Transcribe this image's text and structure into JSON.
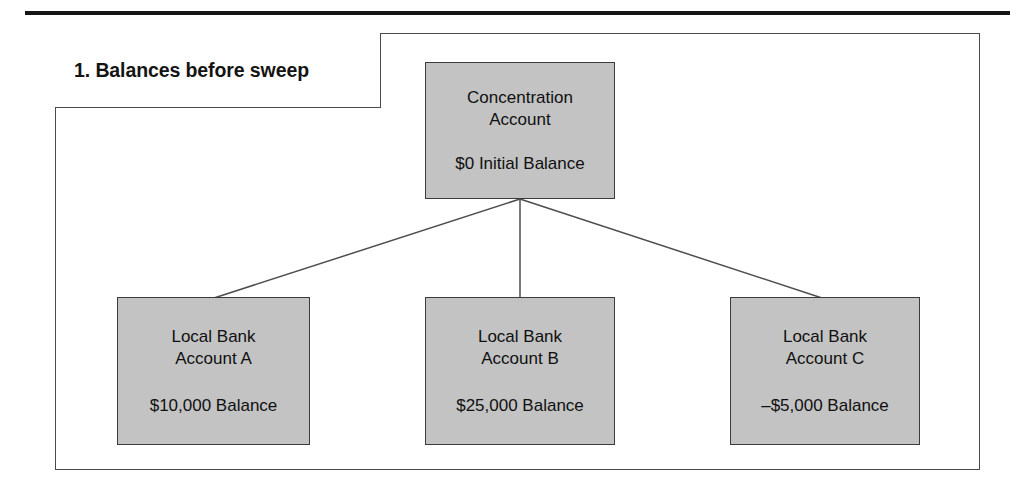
{
  "figure": {
    "step_label": "1. Balances before sweep",
    "fill_color": "#c3c3c3",
    "line_color": "#3c3c3c"
  },
  "diagram": {
    "type": "hierarchy",
    "root": {
      "name": "concentration-account",
      "title": "Concentration\nAccount",
      "balance": "$0 Initial Balance",
      "balance_value": 0
    },
    "children": [
      {
        "name": "local-bank-account-a",
        "title": "Local Bank\nAccount A",
        "balance": "$10,000 Balance",
        "balance_value": 10000
      },
      {
        "name": "local-bank-account-b",
        "title": "Local Bank\nAccount B",
        "balance": "$25,000 Balance",
        "balance_value": 25000
      },
      {
        "name": "local-bank-account-c",
        "title": "Local Bank\nAccount C",
        "balance": "–$5,000 Balance",
        "balance_value": -5000
      }
    ]
  }
}
